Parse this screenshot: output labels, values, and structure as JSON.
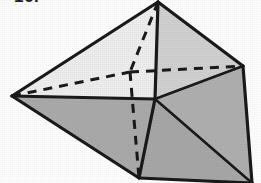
{
  "figure": {
    "caption": "16.",
    "canvas": {
      "width": 261,
      "height": 183,
      "background": "#ffffff"
    },
    "colors": {
      "background": "#ffffff",
      "edge": "#1a1a1a",
      "face_light": "#efefef",
      "face_pale": "#d9d9d9",
      "face_mid": "#cfcfcf",
      "face_gray": "#ababab",
      "face_dark": "#a3a3a3"
    },
    "vertices": [
      {
        "name": "apex-top",
        "x": 158,
        "y": 2
      },
      {
        "name": "vertex-left",
        "x": 12,
        "y": 96
      },
      {
        "name": "vertex-right",
        "x": 243,
        "y": 66
      },
      {
        "name": "vertex-center",
        "x": 155,
        "y": 99
      },
      {
        "name": "vertex-hidden-back",
        "x": 130,
        "y": 72
      },
      {
        "name": "vertex-bottom-front",
        "x": 139,
        "y": 178
      },
      {
        "name": "vertex-bottom-right",
        "x": 252,
        "y": 183
      }
    ],
    "faces": [
      {
        "name": "face-upper-left",
        "fill": "#efefef",
        "points": "158,2 12,96 155,99"
      },
      {
        "name": "face-upper-right",
        "fill": "#d2d2d2",
        "points": "158,2 155,99 243,66"
      },
      {
        "name": "face-lower-left",
        "fill": "#ababab",
        "points": "12,96 155,99 139,178"
      },
      {
        "name": "face-lower-mid",
        "fill": "#a8a8a8",
        "points": "155,99 139,178 252,183"
      },
      {
        "name": "face-lower-right",
        "fill": "#b0b0b0",
        "points": "155,99 252,183 243,66"
      }
    ],
    "solid_edges": [
      {
        "name": "edge-apex-to-left",
        "x1": 158,
        "y1": 2,
        "x2": 12,
        "y2": 96
      },
      {
        "name": "edge-apex-to-right",
        "x1": 158,
        "y1": 2,
        "x2": 243,
        "y2": 66
      },
      {
        "name": "edge-apex-to-center",
        "x1": 158,
        "y1": 2,
        "x2": 155,
        "y2": 99
      },
      {
        "name": "edge-left-to-center",
        "x1": 12,
        "y1": 96,
        "x2": 155,
        "y2": 99
      },
      {
        "name": "edge-right-to-center",
        "x1": 243,
        "y1": 66,
        "x2": 155,
        "y2": 99
      },
      {
        "name": "edge-left-to-bottomfront",
        "x1": 12,
        "y1": 96,
        "x2": 139,
        "y2": 178
      },
      {
        "name": "edge-center-to-bottomfront",
        "x1": 155,
        "y1": 99,
        "x2": 139,
        "y2": 178
      },
      {
        "name": "edge-center-to-bottomright",
        "x1": 155,
        "y1": 99,
        "x2": 252,
        "y2": 183
      },
      {
        "name": "edge-bottomfront-to-bottomright",
        "x1": 139,
        "y1": 178,
        "x2": 252,
        "y2": 183
      },
      {
        "name": "edge-right-to-bottomright",
        "x1": 243,
        "y1": 66,
        "x2": 252,
        "y2": 183
      }
    ],
    "hidden_edges": [
      {
        "name": "hidden-edge-left-to-back",
        "x1": 12,
        "y1": 96,
        "x2": 130,
        "y2": 72
      },
      {
        "name": "hidden-edge-back-to-right",
        "x1": 130,
        "y1": 72,
        "x2": 243,
        "y2": 66
      },
      {
        "name": "hidden-edge-apex-to-back",
        "x1": 158,
        "y1": 2,
        "x2": 130,
        "y2": 72
      },
      {
        "name": "hidden-edge-back-to-bottomfront",
        "x1": 130,
        "y1": 72,
        "x2": 139,
        "y2": 178
      }
    ]
  }
}
